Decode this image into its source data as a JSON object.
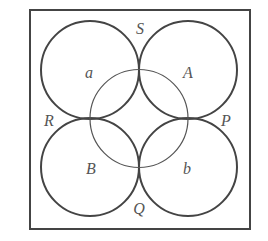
{
  "diagram": {
    "type": "geometric-circles-in-square",
    "frame": {
      "x": 30,
      "y": 10,
      "width": 220,
      "height": 219,
      "stroke": "#444444"
    },
    "outer_circles": [
      {
        "id": "a",
        "cx": 90,
        "cy": 70,
        "r": 49
      },
      {
        "id": "A",
        "cx": 188,
        "cy": 70,
        "r": 49
      },
      {
        "id": "B",
        "cx": 90,
        "cy": 167,
        "r": 49
      },
      {
        "id": "b",
        "cx": 188,
        "cy": 167,
        "r": 49
      }
    ],
    "center_circle": {
      "cx": 139,
      "cy": 118.5,
      "r": 49
    },
    "stroke_color": "#444444",
    "labels": {
      "S": "S",
      "R": "R",
      "P": "P",
      "Q": "Q",
      "a": "a",
      "A": "A",
      "B": "B",
      "b": "b"
    }
  }
}
